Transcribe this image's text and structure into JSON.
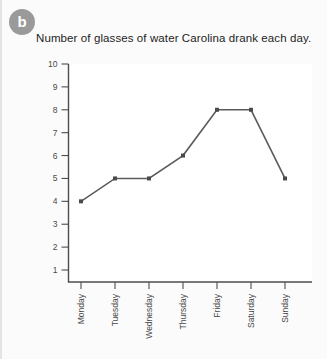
{
  "badge": {
    "label": "b",
    "color": "#9a9a9a"
  },
  "chart_data": {
    "type": "line",
    "title": "Number of glasses of water Carolina drank each day.",
    "xlabel": "",
    "ylabel": "",
    "categories": [
      "Monday",
      "Tuesday",
      "Wednesday",
      "Thursday",
      "Friday",
      "Saturday",
      "Sunday"
    ],
    "values": [
      4,
      5,
      5,
      6,
      8,
      8,
      5
    ],
    "ytick_labels": [
      "10",
      "9",
      "8",
      "7",
      "6",
      "5",
      "4",
      "3",
      "2",
      "1"
    ],
    "ytick_values": [
      10,
      9,
      8,
      7,
      6,
      5,
      4,
      3,
      2,
      1
    ],
    "ylim": [
      0,
      10
    ],
    "grid": false,
    "legend": false,
    "line_color": "#5b5b5b",
    "marker_color": "#4a4a4a",
    "axis_color": "#4d4d4d",
    "plot_background": "#ffffff"
  }
}
